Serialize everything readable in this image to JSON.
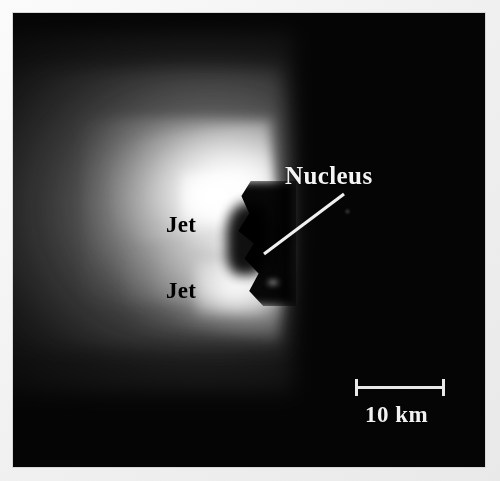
{
  "figure": {
    "kind": "astronomical-grayscale-image",
    "background_color": "#050505",
    "matte_color": "#f2f2f2"
  },
  "annotations": {
    "nucleus_label": "Nucleus",
    "jet_label_upper": "Jet",
    "jet_label_lower": "Jet",
    "nucleus_label_color": "#f4f4f4",
    "jet_label_color": "#000000",
    "leader_line_color": "#f0f0f0"
  },
  "scale_bar": {
    "label": "10 km",
    "label_color": "#f2f2f2",
    "bar_color": "#e9e9e9",
    "length_px": 88,
    "value": 10,
    "unit": "km"
  }
}
